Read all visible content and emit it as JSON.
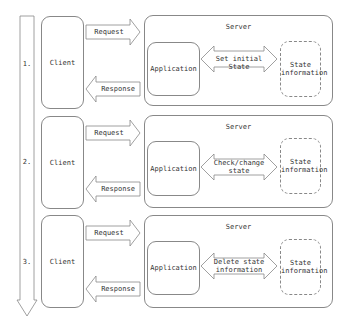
{
  "diagram": {
    "steps": [
      {
        "number": "1.",
        "client_label": "Client",
        "request_label": "Request",
        "response_label": "Response",
        "server_label": "Server",
        "application_label": "Application",
        "action_label": "Set initial State",
        "state_label": "State\ninformation"
      },
      {
        "number": "2.",
        "client_label": "Client",
        "request_label": "Request",
        "response_label": "Response",
        "server_label": "Server",
        "application_label": "Application",
        "action_label": "Check/change\nstate",
        "state_label": "State\ninformation"
      },
      {
        "number": "3.",
        "client_label": "Client",
        "request_label": "Request",
        "response_label": "Response",
        "server_label": "Server",
        "application_label": "Application",
        "action_label": "Delete state\ninformation",
        "state_label": "State\ninformation"
      }
    ],
    "colors": {
      "stroke": "#888888",
      "text": "#333333",
      "background": "#ffffff"
    }
  }
}
